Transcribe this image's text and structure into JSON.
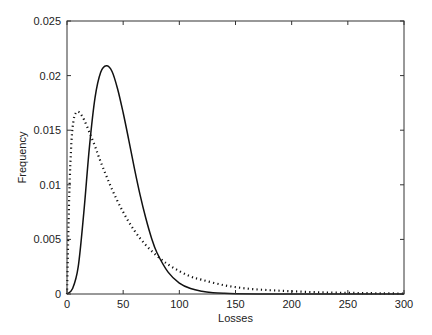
{
  "chart_data": {
    "type": "line",
    "title": "",
    "xlabel": "Losses",
    "ylabel": "Frequency",
    "xlim": [
      0,
      300
    ],
    "ylim": [
      0,
      0.025
    ],
    "grid": false,
    "legend": "none",
    "xticks": [
      0,
      50,
      100,
      150,
      200,
      250,
      300
    ],
    "xtick_labels": [
      "0",
      "50",
      "100",
      "150",
      "200",
      "250",
      "300"
    ],
    "yticks": [
      0,
      0.005,
      0.01,
      0.015,
      0.02,
      0.025
    ],
    "ytick_labels": [
      "0",
      "0.005",
      "0.01",
      "0.015",
      "0.02",
      "0.025"
    ],
    "series": [
      {
        "name": "solid",
        "style": "solid",
        "color": "#111111",
        "x": [
          0,
          5,
          10,
          15,
          20,
          25,
          30,
          35,
          40,
          45,
          50,
          55,
          60,
          65,
          70,
          75,
          80,
          90,
          100,
          110,
          120,
          130,
          140,
          150,
          170,
          200,
          250,
          300
        ],
        "y": [
          0,
          0.0005,
          0.0025,
          0.0075,
          0.0135,
          0.018,
          0.0203,
          0.0209,
          0.0204,
          0.0188,
          0.0166,
          0.0141,
          0.0115,
          0.0091,
          0.007,
          0.0052,
          0.0038,
          0.002,
          0.001,
          0.0005,
          0.00025,
          0.00012,
          6e-05,
          3e-05,
          1e-05,
          0,
          0,
          0
        ]
      },
      {
        "name": "dotted",
        "style": "dotted",
        "color": "#111111",
        "x": [
          0,
          2,
          4,
          6,
          8,
          10,
          12,
          15,
          20,
          25,
          30,
          40,
          50,
          60,
          70,
          80,
          90,
          100,
          110,
          120,
          140,
          160,
          180,
          200,
          220,
          240,
          260,
          280,
          300
        ],
        "y": [
          0,
          0.009,
          0.014,
          0.016,
          0.0166,
          0.0167,
          0.0165,
          0.016,
          0.0148,
          0.0135,
          0.0121,
          0.0096,
          0.0075,
          0.0058,
          0.0045,
          0.0035,
          0.0027,
          0.0021,
          0.0016,
          0.0013,
          0.0008,
          0.0005,
          0.00035,
          0.00025,
          0.00017,
          0.00012,
          9e-05,
          6e-05,
          4e-05
        ]
      }
    ]
  }
}
